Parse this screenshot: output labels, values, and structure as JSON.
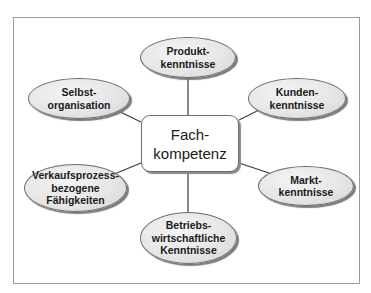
{
  "diagram": {
    "center": {
      "label": "Fach-\nkompetenz"
    },
    "nodes": [
      {
        "id": "produkt",
        "label": "Produkt-\nkenntnisse"
      },
      {
        "id": "selbst",
        "label": "Selbst-\norganisation"
      },
      {
        "id": "kunden",
        "label": "Kunden-\nkenntnisse"
      },
      {
        "id": "verkauf",
        "label": "Verkaufsprozess-\nbezogene\nFähigkeiten"
      },
      {
        "id": "markt",
        "label": "Markt-\nkenntnisse"
      },
      {
        "id": "betrieb",
        "label": "Betriebs-\nwirtschaftliche\nKenntnisse"
      }
    ],
    "colors": {
      "line": "#3a3a3a",
      "ellipse_fill": "#e6e6e6",
      "ellipse_border": "#6e6e6e",
      "frame_border": "#9a9a9a"
    }
  }
}
